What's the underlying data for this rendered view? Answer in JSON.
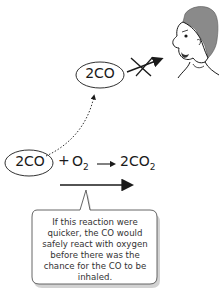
{
  "diagram": {
    "molecule_label": "2CO",
    "equation": {
      "reactant1": "2CO",
      "plus": "+",
      "reactant2_base": "O",
      "reactant2_sub": "2",
      "product_base": "2CO",
      "product_sub": "2"
    },
    "callout_text": "If this reaction were quicker, the CO would safely react with oxygen before there was the chance for the CO to be inhaled.",
    "icons": [
      "person-face",
      "crossed-arrow",
      "dotted-curve-arrow",
      "reaction-arrow",
      "long-rate-arrow"
    ],
    "colors": {
      "line": "#1a1a1a",
      "hair": "#8a8a8a",
      "callout_border": "#555555",
      "callout_shadow": "#bfbfbf"
    }
  }
}
